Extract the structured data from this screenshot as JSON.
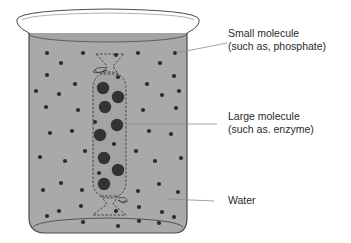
{
  "diagram": {
    "colors": {
      "water": "#a9a9a9",
      "beaker_outline": "#4a4a4a",
      "small_molecule": "#2b2b2b",
      "large_molecule": "#333333",
      "leader_line": "#8a8a8a",
      "label_text": "#2a2a2a"
    },
    "labels": [
      {
        "id": "small-molecule",
        "line1": "Small molecule",
        "line2": "(such as, phosphate)",
        "x": 228,
        "y": 27,
        "pointer_from": [
          227,
          43
        ],
        "pointer_to": [
          176,
          53
        ]
      },
      {
        "id": "large-molecule",
        "line1": "Large molecule",
        "line2": "(such as. enzyme)",
        "x": 228,
        "y": 110,
        "pointer_from": [
          217,
          124
        ],
        "pointer_to": [
          125,
          124
        ]
      },
      {
        "id": "water",
        "line1": "Water",
        "line2": "",
        "x": 228,
        "y": 194,
        "pointer_from": [
          214,
          201
        ],
        "pointer_to": [
          168,
          199
        ]
      }
    ],
    "small_molecules": [
      [
        47,
        53
      ],
      [
        83,
        53
      ],
      [
        116,
        55
      ],
      [
        138,
        53
      ],
      [
        175,
        53
      ],
      [
        61,
        63
      ],
      [
        160,
        63
      ],
      [
        47,
        75
      ],
      [
        118,
        77
      ],
      [
        174,
        76
      ],
      [
        75,
        84
      ],
      [
        147,
        84
      ],
      [
        36,
        91
      ],
      [
        59,
        94
      ],
      [
        162,
        95
      ],
      [
        179,
        91
      ],
      [
        46,
        107
      ],
      [
        78,
        110
      ],
      [
        143,
        110
      ],
      [
        176,
        108
      ],
      [
        95,
        122
      ],
      [
        50,
        133
      ],
      [
        72,
        131
      ],
      [
        149,
        131
      ],
      [
        171,
        134
      ],
      [
        114,
        144
      ],
      [
        85,
        151
      ],
      [
        136,
        151
      ],
      [
        40,
        157
      ],
      [
        65,
        161
      ],
      [
        155,
        161
      ],
      [
        181,
        158
      ],
      [
        99,
        173
      ],
      [
        61,
        183
      ],
      [
        159,
        184
      ],
      [
        43,
        190
      ],
      [
        82,
        190
      ],
      [
        138,
        191
      ],
      [
        178,
        192
      ],
      [
        81,
        206
      ],
      [
        139,
        207
      ],
      [
        59,
        211
      ],
      [
        116,
        211
      ],
      [
        162,
        212
      ],
      [
        47,
        216
      ],
      [
        174,
        217
      ],
      [
        83,
        222
      ],
      [
        139,
        221
      ],
      [
        159,
        223
      ],
      [
        118,
        226
      ]
    ],
    "large_molecules": [
      [
        103,
        88
      ],
      [
        118,
        97
      ],
      [
        105,
        107
      ],
      [
        117,
        125
      ],
      [
        100,
        135
      ],
      [
        104,
        158
      ],
      [
        118,
        170
      ],
      [
        104,
        184
      ]
    ]
  }
}
